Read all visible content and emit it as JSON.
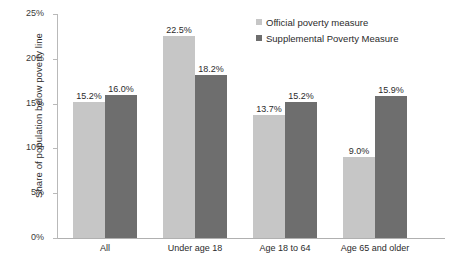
{
  "chart_data": {
    "type": "bar",
    "title": "",
    "xlabel": "",
    "ylabel": "Share of population below poverty line",
    "categories": [
      "All",
      "Under age 18",
      "Age 18 to 64",
      "Age 65 and older"
    ],
    "series": [
      {
        "name": "Official poverty measure",
        "color": "#c6c6c6",
        "values": [
          15.2,
          22.5,
          13.7,
          9.0
        ],
        "labels": [
          "15.2%",
          "22.5%",
          "13.7%",
          "9.0%"
        ]
      },
      {
        "name": "Supplemental Poverty Measure",
        "color": "#6e6e6e",
        "values": [
          16.0,
          18.2,
          15.2,
          15.9
        ],
        "labels": [
          "16.0%",
          "18.2%",
          "15.2%",
          "15.9%"
        ]
      }
    ],
    "ylim": [
      0,
      25
    ],
    "yticks": [
      0,
      5,
      10,
      15,
      20,
      25
    ],
    "ytick_labels": [
      "0%",
      "5%",
      "10%",
      "15%",
      "20%",
      "25%"
    ],
    "grid": false,
    "legend_position": "top-right"
  }
}
